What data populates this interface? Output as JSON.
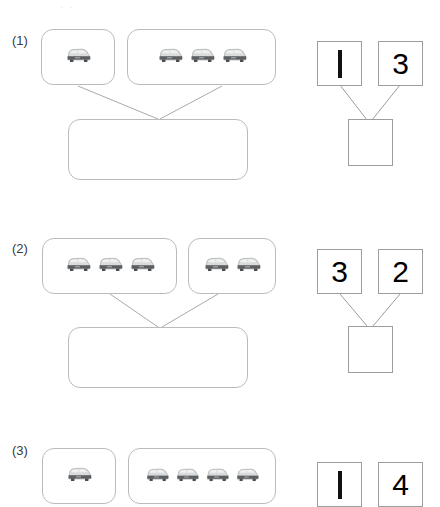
{
  "document": {
    "type": "math-worksheet",
    "topic": "number-bonds-with-cars",
    "faint_top_mark": "· ·"
  },
  "problems": [
    {
      "label": "(1)",
      "groups": [
        {
          "car_count": 1
        },
        {
          "car_count": 3
        }
      ],
      "answer_box_value": "",
      "number_bond": {
        "left": "1",
        "right": "3",
        "total": ""
      }
    },
    {
      "label": "(2)",
      "groups": [
        {
          "car_count": 3
        },
        {
          "car_count": 2
        }
      ],
      "answer_box_value": "",
      "number_bond": {
        "left": "3",
        "right": "2",
        "total": ""
      }
    },
    {
      "label": "(3)",
      "groups": [
        {
          "car_count": 1
        },
        {
          "car_count": 4
        }
      ],
      "answer_box_value": "",
      "number_bond": {
        "left": "1",
        "right": "4",
        "total": ""
      }
    }
  ],
  "icons": {
    "car": "car-icon"
  },
  "colors": {
    "box_border": "#b9bcbd",
    "num_box_border": "#9d9d9d",
    "connector": "#a8abac",
    "text": "#3a3a3a",
    "car_body_dark": "#5c5f61",
    "car_body_light": "#d7d9da",
    "car_window": "#eceded"
  }
}
